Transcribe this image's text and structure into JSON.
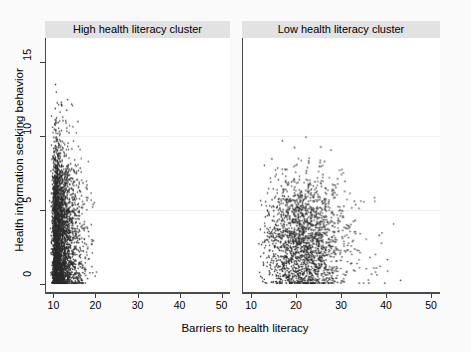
{
  "chart_data": {
    "type": "scatter",
    "title": "",
    "xlabel": "Barriers to health literacy",
    "ylabel": "Health information seeking behavior",
    "xlim": [
      8,
      52
    ],
    "ylim": [
      -0.6,
      16.6
    ],
    "xticks": [
      10,
      20,
      30,
      40,
      50
    ],
    "yticks": [
      0,
      5,
      10,
      15
    ],
    "grid": "faint-horizontal",
    "legend": "none",
    "marker": {
      "shape": "circle",
      "size_px": 1.6,
      "color": "#2b2b2b"
    },
    "panels": [
      {
        "label": "High health literacy cluster",
        "n_points": 3400,
        "x_range": [
          8.6,
          23.5
        ],
        "y_range": [
          0,
          16.3
        ],
        "description": "Dense vertical band hugging the left edge; mode near x=10-12, density falls off sharply beyond x=16; points span full y range with heaviest mass between y=1 and y=7; a distinct row of points sits exactly at y=0.",
        "cluster": {
          "x_mode": 10.2,
          "x_decay": 2.6,
          "y_mode": 3.4,
          "y_spread": 3.1
        }
      },
      {
        "label": "Low health literacy cluster",
        "n_points": 2000,
        "x_range": [
          11.5,
          46.5
        ],
        "y_range": [
          0,
          13.2
        ],
        "description": "Broad cloud centred near x=21, y=3; long thin right tail reaching x=46; sparse scattering above y=8 and very few points above y=11; a row of points sits at y=0.",
        "cluster": {
          "x_mode": 21.0,
          "x_spread": 4.4,
          "y_mode": 3.0,
          "y_spread": 2.3
        }
      }
    ]
  },
  "figure": {
    "background_color": "#fafafa",
    "panel_background": "#ffffff",
    "title_band_color": "#e2e2e2",
    "axis_color": "#4a4a4a",
    "point_color": "#2b2b2b"
  }
}
